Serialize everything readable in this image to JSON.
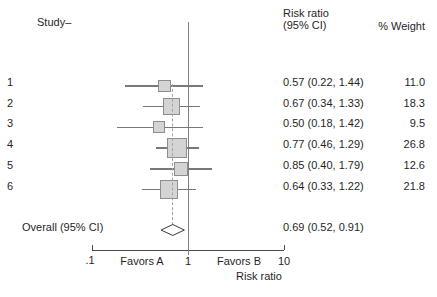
{
  "header": {
    "study_label": "Study–",
    "rr_col_line1": "Risk ratio",
    "rr_col_line2": "(95% CI)",
    "weight_col": "% Weight"
  },
  "axis": {
    "tick_labels": [
      ".1",
      "1",
      "10"
    ],
    "favors_a": "Favors A",
    "favors_b": "Favors B",
    "axis_title": "Risk ratio"
  },
  "colors": {
    "background": "#ffffff",
    "text": "#1f1f1f",
    "axis_line": "#4a4a4a",
    "reference_line": "#808080",
    "ci_line": "#787878",
    "square_fill": "#d4d4d4",
    "square_border": "#8e8e8e",
    "overall_dashed_line": "#a3a3a3",
    "diamond_outline": "#3a3a3a",
    "diamond_fill": "#ffffff"
  },
  "chart_data": {
    "type": "forest",
    "x_scale": "log10",
    "x_range": [
      0.1,
      10
    ],
    "x_ticks": [
      0.1,
      1,
      10
    ],
    "xlabel": "Risk ratio",
    "reference_value": 1,
    "columns": [
      "Study",
      "Risk ratio (95% CI)",
      "% Weight"
    ],
    "studies": [
      {
        "label": "1",
        "est": 0.57,
        "lo": 0.22,
        "hi": 1.44,
        "weight": 11.0,
        "rr_text": "0.57 (0.22, 1.44)",
        "weight_text": "11.0"
      },
      {
        "label": "2",
        "est": 0.67,
        "lo": 0.34,
        "hi": 1.33,
        "weight": 18.3,
        "rr_text": "0.67 (0.34, 1.33)",
        "weight_text": "18.3"
      },
      {
        "label": "3",
        "est": 0.5,
        "lo": 0.18,
        "hi": 1.42,
        "weight": 9.5,
        "rr_text": "0.50 (0.18, 1.42)",
        "weight_text": "9.5"
      },
      {
        "label": "4",
        "est": 0.77,
        "lo": 0.46,
        "hi": 1.29,
        "weight": 26.8,
        "rr_text": "0.77 (0.46, 1.29)",
        "weight_text": "26.8"
      },
      {
        "label": "5",
        "est": 0.85,
        "lo": 0.4,
        "hi": 1.79,
        "weight": 12.6,
        "rr_text": "0.85 (0.40, 1.79)",
        "weight_text": "12.6"
      },
      {
        "label": "6",
        "est": 0.64,
        "lo": 0.33,
        "hi": 1.22,
        "weight": 21.8,
        "rr_text": "0.64 (0.33, 1.22)",
        "weight_text": "21.8"
      }
    ],
    "overall": {
      "label": "Overall (95% CI)",
      "est": 0.69,
      "lo": 0.52,
      "hi": 0.91,
      "rr_text": "0.69 (0.52, 0.91)"
    }
  }
}
